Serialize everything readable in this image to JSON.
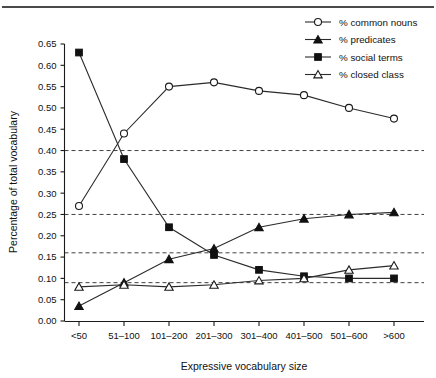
{
  "chart_data": {
    "type": "line",
    "title": "",
    "subtitle": "",
    "xlabel": "Expressive vocabulary size",
    "ylabel": "Percentage of total vocabulary",
    "categories": [
      "<50",
      "51–100",
      "101–200",
      "201–300",
      "301–400",
      "401–500",
      "501–600",
      ">600"
    ],
    "ylim": [
      0.0,
      0.65
    ],
    "yticks": [
      "0.00",
      "0.05",
      "0.10",
      "0.15",
      "0.20",
      "0.25",
      "0.30",
      "0.35",
      "0.40",
      "0.45",
      "0.50",
      "0.55",
      "0.60",
      "0.65"
    ],
    "ytick_values": [
      0.0,
      0.05,
      0.1,
      0.15,
      0.2,
      0.25,
      0.3,
      0.35,
      0.4,
      0.45,
      0.5,
      0.55,
      0.6,
      0.65
    ],
    "grid": false,
    "reference_lines": [
      0.4,
      0.25,
      0.16,
      0.09
    ],
    "legend_position": "top-right",
    "series": [
      {
        "name": "% common nouns",
        "marker": "open-circle",
        "values": [
          0.27,
          0.44,
          0.55,
          0.56,
          0.54,
          0.53,
          0.5,
          0.475
        ]
      },
      {
        "name": "% predicates",
        "marker": "filled-triangle",
        "values": [
          0.035,
          0.09,
          0.145,
          0.17,
          0.22,
          0.24,
          0.25,
          0.255
        ]
      },
      {
        "name": "% social terms",
        "marker": "filled-square",
        "values": [
          0.63,
          0.38,
          0.22,
          0.155,
          0.12,
          0.105,
          0.1,
          0.1
        ]
      },
      {
        "name": "% closed class",
        "marker": "open-triangle",
        "values": [
          0.08,
          0.085,
          0.08,
          0.085,
          0.095,
          0.1,
          0.12,
          0.13
        ]
      }
    ]
  },
  "legend": {
    "entries": [
      {
        "label": "% common nouns"
      },
      {
        "label": "% predicates"
      },
      {
        "label": "% social terms"
      },
      {
        "label": "% closed class"
      }
    ]
  }
}
